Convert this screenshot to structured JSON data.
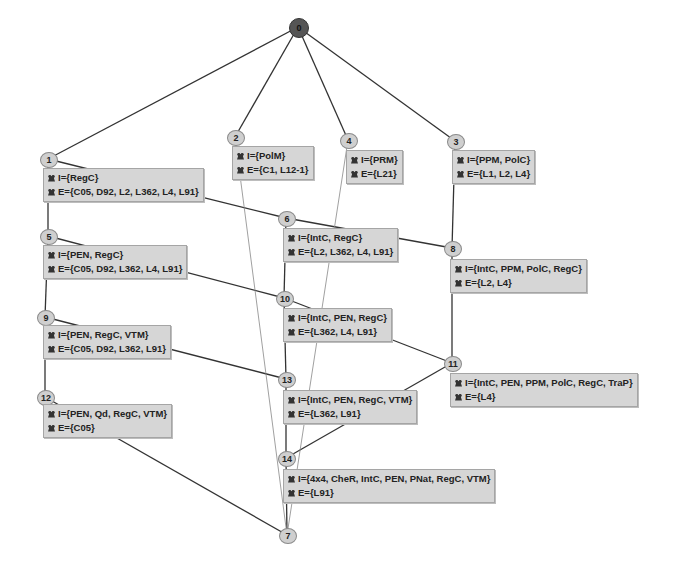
{
  "diagram": {
    "type": "concept-lattice",
    "nodes": [
      {
        "id": "0",
        "intent": "",
        "extent": "",
        "x": 289,
        "y": 18,
        "top": true
      },
      {
        "id": "1",
        "intent": "I={RegC}",
        "extent": "E={C05, D92, L2, L362, L4, L91}",
        "x": 40,
        "y": 152,
        "box_x": 43,
        "box_y": 168
      },
      {
        "id": "2",
        "intent": "I={PolM}",
        "extent": "E={C1, L12-1}",
        "x": 227,
        "y": 130,
        "box_x": 232,
        "box_y": 146
      },
      {
        "id": "3",
        "intent": "I={PPM, PolC}",
        "extent": "E={L1, L2, L4}",
        "x": 447,
        "y": 134,
        "box_x": 452,
        "box_y": 150
      },
      {
        "id": "4",
        "intent": "I={PRM}",
        "extent": "E={L21}",
        "x": 340,
        "y": 133,
        "box_x": 346,
        "box_y": 150
      },
      {
        "id": "5",
        "intent": "I={PEN, RegC}",
        "extent": "E={C05, D92, L362, L4, L91}",
        "x": 40,
        "y": 229,
        "box_x": 43,
        "box_y": 245
      },
      {
        "id": "6",
        "intent": "I={IntC, RegC}",
        "extent": "E={L2, L362, L4, L91}",
        "x": 278,
        "y": 211,
        "box_x": 283,
        "box_y": 228
      },
      {
        "id": "7",
        "intent": "",
        "extent": "",
        "x": 279,
        "y": 528
      },
      {
        "id": "8",
        "intent": "I={IntC, PPM, PolC, RegC}",
        "extent": "E={L2, L4}",
        "x": 444,
        "y": 241,
        "box_x": 450,
        "box_y": 259
      },
      {
        "id": "9",
        "intent": "I={PEN, RegC, VTM}",
        "extent": "E={C05, D92, L362, L91}",
        "x": 37,
        "y": 310,
        "box_x": 43,
        "box_y": 325
      },
      {
        "id": "10",
        "intent": "I={IntC, PEN, RegC}",
        "extent": "E={L362, L4, L91}",
        "x": 276,
        "y": 291,
        "box_x": 283,
        "box_y": 308
      },
      {
        "id": "11",
        "intent": "I={IntC, PEN, PPM, PolC, RegC, TraP}",
        "extent": "E={L4}",
        "x": 444,
        "y": 356,
        "box_x": 450,
        "box_y": 373
      },
      {
        "id": "12",
        "intent": "I={PEN, Qd, RegC, VTM}",
        "extent": "E={C05}",
        "x": 37,
        "y": 390,
        "box_x": 43,
        "box_y": 404
      },
      {
        "id": "13",
        "intent": "I={IntC, PEN, RegC, VTM}",
        "extent": "E={L362, L91}",
        "x": 278,
        "y": 372,
        "box_x": 283,
        "box_y": 390
      },
      {
        "id": "14",
        "intent": "I={4x4, CheR, IntC, PEN, PNat, RegC, VTM}",
        "extent": "E={L91}",
        "x": 278,
        "y": 451,
        "box_x": 283,
        "box_y": 469
      }
    ],
    "edges": [
      [
        "0",
        "1"
      ],
      [
        "0",
        "2"
      ],
      [
        "0",
        "4"
      ],
      [
        "0",
        "3"
      ],
      [
        "1",
        "5"
      ],
      [
        "1",
        "6"
      ],
      [
        "3",
        "8"
      ],
      [
        "5",
        "9"
      ],
      [
        "5",
        "10"
      ],
      [
        "6",
        "10"
      ],
      [
        "6",
        "8"
      ],
      [
        "8",
        "11"
      ],
      [
        "9",
        "12"
      ],
      [
        "9",
        "13"
      ],
      [
        "10",
        "13"
      ],
      [
        "10",
        "11"
      ],
      [
        "13",
        "14"
      ],
      [
        "11",
        "14"
      ],
      [
        "12",
        "7"
      ],
      [
        "14",
        "7"
      ],
      [
        "2",
        "7"
      ],
      [
        "4",
        "7"
      ]
    ],
    "colors": {
      "node_fill": "#cfcfcf",
      "top_node_fill": "#555555",
      "box_fill": "#d6d6d6",
      "edge": "#333333"
    }
  }
}
